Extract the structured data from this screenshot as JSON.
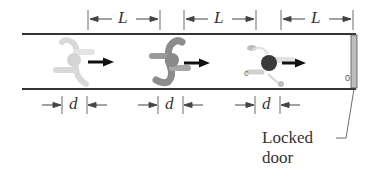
{
  "diagram": {
    "type": "physics-figure",
    "spacing_label": "L",
    "gap_label": "d",
    "door_label_line1": "Locked",
    "door_label_line2": "door",
    "door_knob_mark": "0",
    "positions": [
      {
        "index": 1,
        "shade": "light",
        "label_top": "L",
        "label_bottom": "d"
      },
      {
        "index": 2,
        "shade": "medium",
        "label_top": "L",
        "label_bottom": "d"
      },
      {
        "index": 3,
        "shade": "dark",
        "label_top": "L",
        "label_bottom": "d"
      }
    ],
    "colors": {
      "corridor_line": "#333333",
      "door_fill": "#bdbdbd",
      "runner_light": "#d9d9d9",
      "runner_medium": "#8c8c8c",
      "runner_dark_head": "#3a3a3a",
      "velocity_arrow": "#111111"
    }
  }
}
